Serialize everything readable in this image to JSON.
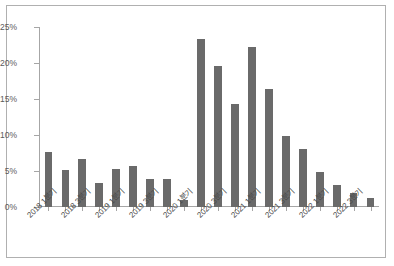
{
  "figure": {
    "background_color": "#ffffff",
    "border_color": "#b0b0b0"
  },
  "chart_data": {
    "type": "bar",
    "title": "",
    "subtitle": "",
    "xlabel": "",
    "ylabel": "",
    "ylim": [
      0,
      25
    ],
    "ytick_values": [
      0,
      5,
      10,
      15,
      20,
      25
    ],
    "ytick_labels": [
      "0%",
      "5%",
      "10%",
      "15%",
      "20%",
      "25%"
    ],
    "grid": false,
    "legend": false,
    "legend_position": "none",
    "bar_color": "#6a6a6a",
    "axis_color": "#a6a6a6",
    "value_suffix": "%",
    "categories": [
      "2018 1분기",
      "2018 2분기",
      "2018 3분기",
      "2018 4분기",
      "2019 1분기",
      "2019 2분기",
      "2019 3분기",
      "2019 4분기",
      "2020 1분기",
      "2020 2분기",
      "2020 3분기",
      "2020 4분기",
      "2021 1분기",
      "2021 2분기",
      "2021 3분기",
      "2021 4분기",
      "2022 1분기",
      "2022 2분기",
      "2022 3분기",
      "2022 4분기"
    ],
    "visible_tick_labels": [
      "2018 1분기",
      "2018 3분기",
      "2019 1분기",
      "2019 3분기",
      "2020 1분기",
      "2020 3분기",
      "2021 1분기",
      "2021 3분기",
      "2022 1분기",
      "2022 3분기"
    ],
    "visible_tick_indices": [
      0,
      2,
      4,
      6,
      8,
      10,
      12,
      14,
      16,
      18
    ],
    "values": [
      7.6,
      5.2,
      6.7,
      3.4,
      5.3,
      5.7,
      3.9,
      3.9,
      1.0,
      23.3,
      19.6,
      14.3,
      22.2,
      16.4,
      9.9,
      8.1,
      4.8,
      3.1,
      2.0,
      1.2
    ]
  }
}
